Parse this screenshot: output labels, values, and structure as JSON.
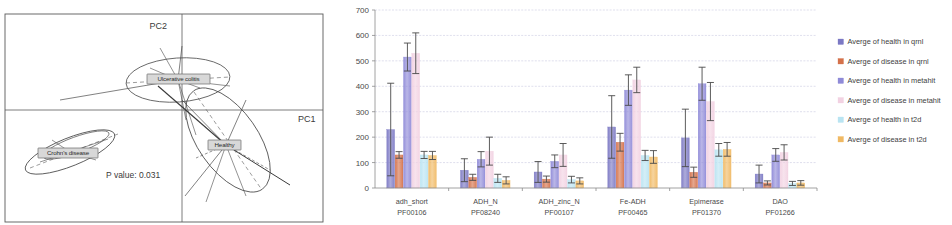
{
  "figure": {
    "panels": [
      "pca-plot",
      "bar-chart"
    ]
  },
  "pca": {
    "axis_x_label": "PC1",
    "axis_y_label": "PC2",
    "pvalue_text": "P value: 0.031",
    "groups": [
      {
        "name": "ulcerative-colitis",
        "label": "Ulcerative colitis"
      },
      {
        "name": "crohns-disease",
        "label": "Crohn's disease"
      },
      {
        "name": "healthy",
        "label": "Healthy"
      }
    ]
  },
  "chart_data": {
    "type": "bar",
    "title": "",
    "xlabel": "",
    "ylabel": "",
    "ylim": [
      0,
      700
    ],
    "yticks": [
      0,
      100,
      200,
      300,
      400,
      500,
      600,
      700
    ],
    "grid": true,
    "legend_position": "right",
    "categories": [
      "adh_short",
      "ADH_N",
      "ADH_zinc_N",
      "Fe-ADH",
      "Epimerase",
      "DAO"
    ],
    "category_accessions": [
      "PF00106",
      "PF08240",
      "PF00107",
      "PF00465",
      "PF01370",
      "PF01266"
    ],
    "series": [
      {
        "name": "Averge of health in qrnl",
        "color": "#7b78c4",
        "values": [
          230,
          70,
          63,
          240,
          197,
          55
        ],
        "errors": [
          182,
          45,
          41,
          123,
          113,
          35
        ]
      },
      {
        "name": "Averge of disease in qrnl",
        "color": "#d4714a",
        "values": [
          130,
          42,
          35,
          180,
          62,
          20
        ],
        "errors": [
          13,
          12,
          12,
          35,
          20,
          8
        ]
      },
      {
        "name": "Averge of health in metahit",
        "color": "#8f8ad8",
        "values": [
          515,
          113,
          105,
          385,
          410,
          130
        ],
        "errors": [
          55,
          30,
          25,
          60,
          65,
          25
        ]
      },
      {
        "name": "Averge of disease in metahit",
        "color": "#f2d2e2",
        "values": [
          530,
          145,
          130,
          425,
          340,
          140
        ],
        "errors": [
          80,
          55,
          45,
          50,
          75,
          30
        ]
      },
      {
        "name": "Averge of health in t2d",
        "color": "#b9e4f2",
        "values": [
          130,
          38,
          33,
          128,
          150,
          18
        ],
        "errors": [
          14,
          16,
          13,
          20,
          25,
          8
        ]
      },
      {
        "name": "Averge of disease in t2d",
        "color": "#f0b963",
        "values": [
          128,
          30,
          28,
          122,
          152,
          20
        ],
        "errors": [
          16,
          14,
          12,
          25,
          27,
          9
        ]
      }
    ]
  }
}
